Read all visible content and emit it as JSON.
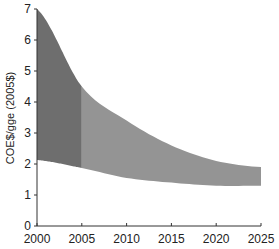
{
  "chart_data": {
    "type": "area",
    "title": "",
    "xlabel": "",
    "ylabel": "COE$/gge (2005$)",
    "xlim": [
      2000,
      2025
    ],
    "ylim": [
      0,
      7
    ],
    "grid": false,
    "legend": null,
    "x_ticks": [
      "2000",
      "2005",
      "2010",
      "2015",
      "2020",
      "2025"
    ],
    "y_ticks": [
      "0",
      "1",
      "2",
      "3",
      "4",
      "5",
      "6",
      "7"
    ],
    "x": [
      2000,
      2005,
      2010,
      2015,
      2020,
      2025
    ],
    "upper": [
      7.0,
      4.5,
      3.4,
      2.6,
      2.1,
      1.9
    ],
    "lower": [
      2.13,
      1.87,
      1.55,
      1.4,
      1.3,
      1.3
    ],
    "regions": [
      {
        "name": "historical",
        "x_range": [
          2000,
          2005
        ],
        "color": "#6e6e6e"
      },
      {
        "name": "projected",
        "x_range": [
          2005,
          2025
        ],
        "color": "#949494"
      }
    ]
  }
}
